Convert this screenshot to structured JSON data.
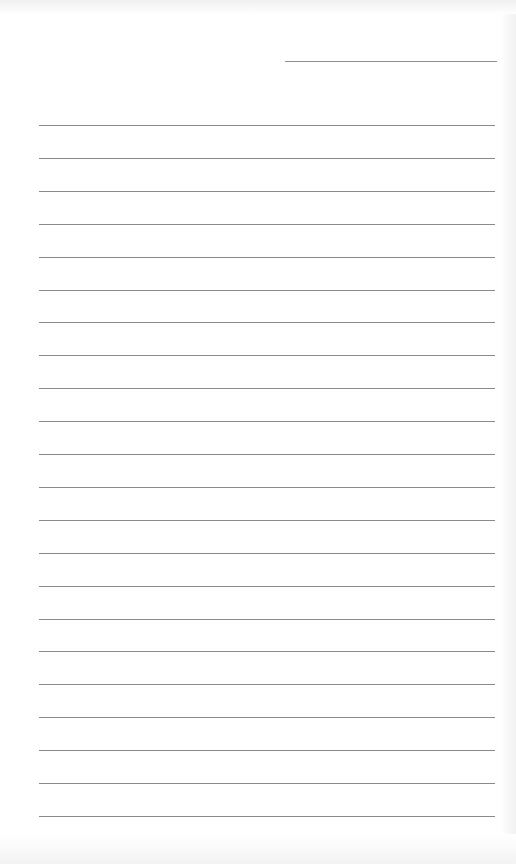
{
  "page": {
    "type": "lined-paper",
    "header_line": {
      "label": ""
    },
    "line_count": 22,
    "lines": [
      "",
      "",
      "",
      "",
      "",
      "",
      "",
      "",
      "",
      "",
      "",
      "",
      "",
      "",
      "",
      "",
      "",
      "",
      "",
      "",
      "",
      ""
    ],
    "colors": {
      "paper": "#ffffff",
      "rule": "#8a8a8a"
    }
  }
}
